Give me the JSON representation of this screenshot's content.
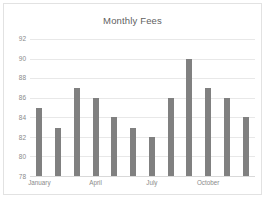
{
  "chart_data": {
    "type": "bar",
    "title": "Monthly Fees",
    "xlabel": "",
    "ylabel": "",
    "categories": [
      "January",
      "February",
      "March",
      "April",
      "May",
      "June",
      "July",
      "August",
      "September",
      "October",
      "November",
      "December"
    ],
    "visible_tick_labels": [
      "January",
      "April",
      "July",
      "October"
    ],
    "values": [
      84.9,
      82.9,
      87.0,
      86.0,
      84.0,
      82.9,
      82.0,
      86.0,
      90.0,
      87.0,
      86.0,
      84.0
    ],
    "ylim": [
      78,
      92
    ],
    "yticks": [
      78,
      80,
      82,
      84,
      86,
      88,
      90,
      92
    ],
    "ytick_labels": [
      "78",
      "80",
      "82",
      "84",
      "86",
      "88",
      "90",
      "92"
    ],
    "grid": true,
    "legend": false,
    "series_color": "#808080",
    "gridline_color": "#e8e8e8",
    "text_color": "#8a8a8a",
    "title_color": "#5f5f5f",
    "plot_background": "#ffffff",
    "border_color": "#e2e2e2"
  }
}
